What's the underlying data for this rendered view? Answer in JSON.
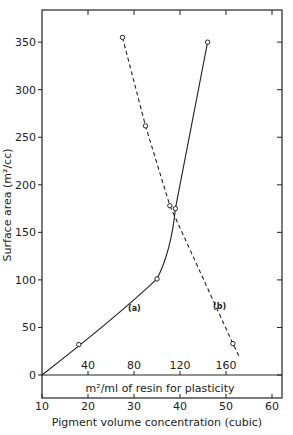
{
  "chart_data": {
    "type": "line",
    "title": "",
    "xlabel": "Pigment volume concentration (cubic)",
    "ylabel": "Surface area (m²/cc)",
    "secondary_xlabel": "m²/ml of resin for plasticity",
    "xlim": [
      10,
      62
    ],
    "ylim": [
      0,
      370
    ],
    "x_ticks": [
      10,
      20,
      30,
      40,
      50,
      60
    ],
    "y_ticks": [
      0,
      50,
      100,
      150,
      200,
      250,
      300,
      350
    ],
    "secondary_x_ticks": [
      40,
      80,
      120,
      160
    ],
    "grid": false,
    "series": [
      {
        "name": "(a)",
        "style": "solid",
        "points": [
          [
            10,
            0
          ],
          [
            18,
            32
          ],
          [
            35,
            101
          ],
          [
            39,
            175
          ],
          [
            46,
            350
          ]
        ]
      },
      {
        "name": "(b)",
        "style": "dashed",
        "points": [
          [
            27.5,
            355
          ],
          [
            32.5,
            262
          ],
          [
            37.8,
            178
          ],
          [
            51.5,
            33
          ],
          [
            53,
            18
          ]
        ]
      }
    ]
  },
  "labels": {
    "xlabel": "Pigment volume concentration (cubic)",
    "ylabel": "Surface area (m²/cc)",
    "secondary_xlabel": "m²/ml of resin for plasticity",
    "curve_a": "(a)",
    "curve_b": "(b)"
  }
}
